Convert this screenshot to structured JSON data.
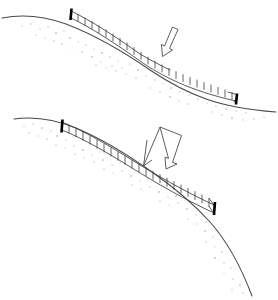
{
  "figure": {
    "title": "Slope face reinforcement profiles",
    "background_color": "#ffffff",
    "width": 278,
    "height": 300,
    "line_color": "#4a4a4a",
    "structure_color": "#3c3c3c",
    "marker_color": "#000000",
    "stipple_color": "#b9b3bd"
  },
  "panels": [
    {
      "id": "upper-panel",
      "name": "upper-slope-profile",
      "label": "Upper slope profile",
      "slope": {
        "name": "upper-slope-line",
        "description": "Concave slope ground surface descending left to right",
        "path": "M 2 18 C 22 14, 44 16, 66 24 C 92 34, 124 52, 150 70 C 168 82, 186 92, 206 99 C 226 106, 248 110, 276 112"
      },
      "structure": {
        "name": "upper-reinforcement-ladder",
        "label": "Reinforcement ladder (upper)",
        "rung_count": 24,
        "rail_note": "upper rail present over left half, fades to free tick marks on right half",
        "start": {
          "x": 71,
          "y": 12
        },
        "end": {
          "x": 236,
          "y": 98
        }
      },
      "end_markers": [
        {
          "name": "upper-left-end-marker",
          "x": 71,
          "y": 12,
          "label": "left terminal marker"
        },
        {
          "name": "upper-right-end-marker",
          "x": 236,
          "y": 98,
          "label": "right terminal marker"
        }
      ],
      "arrow": {
        "name": "upper-annotation-arrow",
        "label": "Annotation arrow (upper)",
        "style": "outline",
        "direction": "down-left",
        "tip": {
          "x": 163,
          "y": 55
        },
        "tail": {
          "x": 175,
          "y": 28
        }
      }
    },
    {
      "id": "lower-panel",
      "name": "lower-slope-profile",
      "label": "Lower slope profile",
      "slope": {
        "name": "lower-slope-line",
        "description": "Concave slope ground surface descending left to right with steeper tail",
        "path": "M 14 119 C 34 116, 54 119, 76 128 C 102 139, 128 155, 152 172 C 172 186, 192 202, 210 222 C 226 240, 240 264, 252 296"
      },
      "structure": {
        "name": "lower-reinforcement-ladder",
        "label": "Reinforcement ladder (lower)",
        "rung_count": 22,
        "rail_note": "full closed cells with both rails along entire run",
        "start": {
          "x": 62,
          "y": 123
        },
        "end": {
          "x": 214,
          "y": 208
        }
      },
      "end_markers": [
        {
          "name": "lower-left-end-marker",
          "x": 62,
          "y": 123,
          "label": "left terminal marker"
        },
        {
          "name": "lower-right-end-marker",
          "x": 214,
          "y": 208,
          "label": "right terminal marker"
        }
      ],
      "arrow": {
        "name": "lower-annotation-arrow",
        "label": "Annotation arrow (lower)",
        "style": "outline",
        "direction": "down-left",
        "tip": {
          "x": 142,
          "y": 166
        },
        "tail": {
          "x": 170,
          "y": 128
        }
      }
    }
  ],
  "texture": {
    "name": "soil-stipple",
    "label": "Stippled soil texture below slope surface",
    "style": "sparse random dots"
  }
}
